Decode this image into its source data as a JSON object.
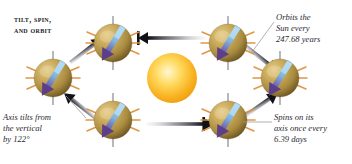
{
  "figure": {
    "title_line1": "Tilt, spin,",
    "title_line2": "and orbit",
    "background": "#ffffff"
  },
  "sun": {
    "name": "Sun",
    "center_color": "#fff3b0",
    "edge_color": "#f0a00f",
    "cx": 172,
    "cy": 78,
    "r": 25
  },
  "planets": [
    {
      "id": "planet-top-left",
      "cx": 113,
      "cy": 43,
      "r": 19
    },
    {
      "id": "planet-top-right",
      "cx": 228,
      "cy": 43,
      "r": 19
    },
    {
      "id": "planet-right",
      "cx": 280,
      "cy": 78,
      "r": 19
    },
    {
      "id": "planet-bottom-right",
      "cx": 228,
      "cy": 120,
      "r": 19
    },
    {
      "id": "planet-bottom-left",
      "cx": 113,
      "cy": 120,
      "r": 19
    },
    {
      "id": "planet-left",
      "cx": 53,
      "cy": 78,
      "r": 19
    }
  ],
  "planet_style": {
    "body_light": "#d8bc72",
    "body_mid": "#b79545",
    "body_dark": "#6d5520",
    "spoke_color": "#e0913c",
    "vertical_axis_color": "#7d7d8c",
    "axis_arrow_shaft": "#9cc9e8",
    "axis_arrow_head": "#5b3f8c",
    "tilt_degrees": 122
  },
  "orbit_arrows": [
    {
      "id": "arrow-top",
      "direction": "left"
    },
    {
      "id": "arrow-bottom",
      "direction": "right"
    },
    {
      "id": "arrow-upper-left",
      "direction": "up-right"
    },
    {
      "id": "arrow-lower-left",
      "direction": "up-right"
    },
    {
      "id": "arrow-upper-right",
      "direction": "down-left"
    },
    {
      "id": "arrow-lower-right",
      "direction": "up-right"
    }
  ],
  "callouts": {
    "orbit": {
      "text": "Orbits the\nSun every\n247.68 years",
      "value": "247.68 years"
    },
    "spin": {
      "text": "Spins on its\naxis once every\n6.39 days",
      "value": "6.39 days"
    },
    "tilt": {
      "text": "Axis tilts from\nthe vertical\nby 122°",
      "value": "122°"
    }
  }
}
